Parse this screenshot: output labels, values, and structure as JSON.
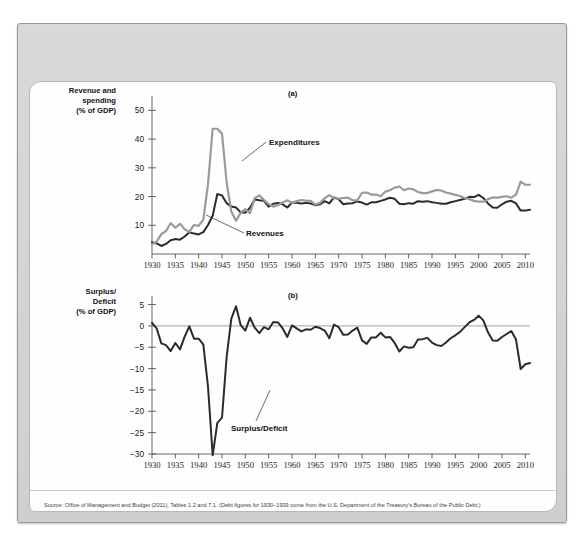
{
  "figure": {
    "source": "Source: Office of Management and Budget (2011), Tables 1.2 and 7.1. (Debt figures for 1930–1939 come from the U.S. Department of the Treasury's Bureau of the Public Debt.)",
    "panel_a_id": "(a)",
    "panel_b_id": "(b)",
    "panel_a_axis_title": "Revenue and\nspending\n(% of GDP)",
    "panel_b_axis_title": "Surplus/\nDeficit\n(% of GDP)",
    "colors": {
      "revenues": "#2b2b2b",
      "expenditures": "#9a9a9a",
      "surplus_deficit": "#2b2b2b",
      "frame": "#9a9a9a",
      "header": "#d4d4d4",
      "panel": "#fefefe"
    }
  },
  "chart_data": [
    {
      "type": "line",
      "panel": "(a)",
      "title": "Federal Revenues and Expenditures (% of GDP), 1930–2011",
      "xlabel": "",
      "ylabel": "Revenue and spending (% of GDP)",
      "xlim": [
        1930,
        2011
      ],
      "ylim": [
        0,
        55
      ],
      "yticks": [
        10,
        20,
        30,
        40,
        50
      ],
      "xticks": [
        1930,
        1935,
        1940,
        1945,
        1950,
        1955,
        1960,
        1965,
        1970,
        1975,
        1980,
        1985,
        1990,
        1995,
        2000,
        2005,
        2010
      ],
      "grid": false,
      "legend": "inline-annotations",
      "annotations": [
        {
          "text": "Expenditures",
          "x": 1948,
          "y": 31
        },
        {
          "text": "Revenues",
          "x": 1947,
          "y": 6
        }
      ],
      "x": [
        1930,
        1931,
        1932,
        1933,
        1934,
        1935,
        1936,
        1937,
        1938,
        1939,
        1940,
        1941,
        1942,
        1943,
        1944,
        1945,
        1946,
        1947,
        1948,
        1949,
        1950,
        1951,
        1952,
        1953,
        1954,
        1955,
        1956,
        1957,
        1958,
        1959,
        1960,
        1961,
        1962,
        1963,
        1964,
        1965,
        1966,
        1967,
        1968,
        1969,
        1970,
        1971,
        1972,
        1973,
        1974,
        1975,
        1976,
        1977,
        1978,
        1979,
        1980,
        1981,
        1982,
        1983,
        1984,
        1985,
        1986,
        1987,
        1988,
        1989,
        1990,
        1991,
        1992,
        1993,
        1994,
        1995,
        1996,
        1997,
        1998,
        1999,
        2000,
        2001,
        2002,
        2003,
        2004,
        2005,
        2006,
        2007,
        2008,
        2009,
        2010,
        2011
      ],
      "series": [
        {
          "name": "Revenues",
          "color": "#2b2b2b",
          "values": [
            4.1,
            3.7,
            2.8,
            3.5,
            4.8,
            5.2,
            5.0,
            6.1,
            7.6,
            7.1,
            6.8,
            7.6,
            10.1,
            13.3,
            20.9,
            20.4,
            17.7,
            16.5,
            16.2,
            14.5,
            14.4,
            16.1,
            19.0,
            18.7,
            18.5,
            16.5,
            17.5,
            17.8,
            17.3,
            16.2,
            17.9,
            17.8,
            17.6,
            17.8,
            17.6,
            17.0,
            17.3,
            18.4,
            17.6,
            19.7,
            19.0,
            17.3,
            17.6,
            17.7,
            18.3,
            17.9,
            17.2,
            18.0,
            18.0,
            18.5,
            19.0,
            19.6,
            19.2,
            17.5,
            17.3,
            17.7,
            17.5,
            18.4,
            18.2,
            18.4,
            18.0,
            17.8,
            17.5,
            17.5,
            18.0,
            18.4,
            18.8,
            19.2,
            19.9,
            19.8,
            20.6,
            19.5,
            17.6,
            16.2,
            16.1,
            17.3,
            18.2,
            18.5,
            17.6,
            15.1,
            15.1,
            15.4
          ]
        },
        {
          "name": "Expenditures",
          "color": "#9a9a9a",
          "values": [
            3.4,
            4.3,
            6.9,
            8.0,
            10.7,
            9.2,
            10.5,
            8.6,
            7.7,
            10.1,
            9.8,
            12.0,
            24.3,
            43.6,
            43.6,
            41.9,
            24.8,
            14.8,
            11.6,
            14.3,
            15.6,
            14.2,
            19.4,
            20.4,
            18.8,
            17.3,
            16.5,
            17.0,
            17.9,
            18.7,
            17.8,
            18.4,
            18.8,
            18.6,
            18.5,
            17.2,
            17.8,
            19.4,
            20.5,
            19.4,
            19.3,
            19.5,
            19.6,
            18.7,
            18.7,
            21.3,
            21.4,
            20.7,
            20.7,
            20.1,
            21.7,
            22.2,
            23.1,
            23.5,
            22.2,
            22.8,
            22.5,
            21.6,
            21.2,
            21.2,
            21.8,
            22.3,
            22.1,
            21.4,
            21.0,
            20.6,
            20.2,
            19.5,
            19.1,
            18.5,
            18.2,
            18.2,
            19.1,
            19.7,
            19.6,
            19.9,
            20.1,
            19.6,
            20.7,
            25.2,
            24.1,
            24.1
          ]
        }
      ]
    },
    {
      "type": "line",
      "panel": "(b)",
      "title": "Federal Surplus or Deficit (% of GDP), 1930–2011",
      "xlabel": "",
      "ylabel": "Surplus/Deficit (% of GDP)",
      "xlim": [
        1930,
        2011
      ],
      "ylim": [
        -30,
        7
      ],
      "yticks": [
        5,
        0,
        -5,
        -10,
        -15,
        -20,
        -25,
        -30
      ],
      "xticks": [
        1930,
        1935,
        1940,
        1945,
        1950,
        1955,
        1960,
        1965,
        1970,
        1975,
        1980,
        1985,
        1990,
        1995,
        2000,
        2005,
        2010
      ],
      "grid": false,
      "zeroline": true,
      "annotations": [
        {
          "text": "Surplus/Deficit",
          "x": 1967,
          "y": -7.5
        }
      ],
      "x": [
        1930,
        1931,
        1932,
        1933,
        1934,
        1935,
        1936,
        1937,
        1938,
        1939,
        1940,
        1941,
        1942,
        1943,
        1944,
        1945,
        1946,
        1947,
        1948,
        1949,
        1950,
        1951,
        1952,
        1953,
        1954,
        1955,
        1956,
        1957,
        1958,
        1959,
        1960,
        1961,
        1962,
        1963,
        1964,
        1965,
        1966,
        1967,
        1968,
        1969,
        1970,
        1971,
        1972,
        1973,
        1974,
        1975,
        1976,
        1977,
        1978,
        1979,
        1980,
        1981,
        1982,
        1983,
        1984,
        1985,
        1986,
        1987,
        1988,
        1989,
        1990,
        1991,
        1992,
        1993,
        1994,
        1995,
        1996,
        1997,
        1998,
        1999,
        2000,
        2001,
        2002,
        2003,
        2004,
        2005,
        2006,
        2007,
        2008,
        2009,
        2010,
        2011
      ],
      "series": [
        {
          "name": "Surplus/Deficit",
          "color": "#2b2b2b",
          "values": [
            0.7,
            -0.6,
            -4.1,
            -4.5,
            -5.9,
            -4.0,
            -5.5,
            -2.5,
            -0.1,
            -3.0,
            -3.0,
            -4.4,
            -14.2,
            -30.3,
            -22.7,
            -21.5,
            -7.2,
            1.7,
            4.6,
            0.2,
            -1.1,
            1.9,
            -0.4,
            -1.7,
            -0.3,
            -0.8,
            0.9,
            0.8,
            -0.6,
            -2.6,
            0.1,
            -0.6,
            -1.3,
            -0.8,
            -0.9,
            -0.2,
            -0.5,
            -1.1,
            -2.9,
            0.3,
            -0.3,
            -2.1,
            -2.0,
            -1.1,
            -0.4,
            -3.4,
            -4.2,
            -2.7,
            -2.7,
            -1.6,
            -2.7,
            -2.6,
            -4.0,
            -6.0,
            -4.8,
            -5.1,
            -5.0,
            -3.2,
            -3.1,
            -2.8,
            -3.9,
            -4.5,
            -4.7,
            -3.9,
            -2.9,
            -2.2,
            -1.4,
            -0.3,
            0.8,
            1.4,
            2.4,
            1.3,
            -1.5,
            -3.4,
            -3.5,
            -2.6,
            -1.9,
            -1.2,
            -3.2,
            -10.1,
            -9.0,
            -8.7
          ]
        }
      ]
    }
  ]
}
